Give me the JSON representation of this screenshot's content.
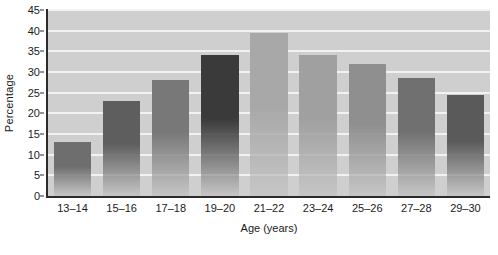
{
  "chart_data": {
    "type": "bar",
    "title": "",
    "xlabel": "Age (years)",
    "ylabel": "Percentage",
    "categories": [
      "13–14",
      "15–16",
      "17–18",
      "19–20",
      "21–22",
      "23–24",
      "25–26",
      "27–28",
      "29–30"
    ],
    "values": [
      13,
      23,
      28,
      34,
      39.5,
      34,
      32,
      28.5,
      24.5
    ],
    "ylim": [
      0,
      45
    ],
    "ytick_labels": [
      "0",
      "5",
      "10",
      "15",
      "20",
      "25",
      "30",
      "35",
      "40",
      "45"
    ],
    "ytick_values": [
      0,
      5,
      10,
      15,
      20,
      25,
      30,
      35,
      40,
      45
    ],
    "grid": true,
    "legend": "none",
    "bar_colors": [
      "#6e6e6e",
      "#5e5e5e",
      "#787878",
      "#3a3a3a",
      "#a8a8a8",
      "#a0a0a0",
      "#8f8f8f",
      "#707070",
      "#5a5a5a"
    ],
    "plot_background": "#cfcfcf",
    "gridline_color": "#f2f2f2",
    "axis_color": "#2b2b2b"
  }
}
